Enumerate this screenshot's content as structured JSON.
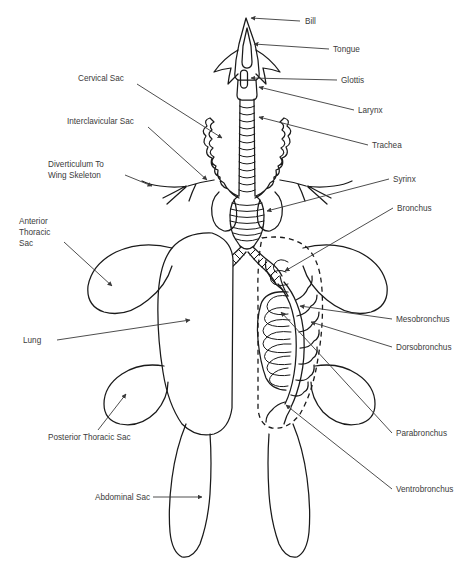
{
  "figure": {
    "background_color": "#ffffff",
    "line_color": "#1a1a1a",
    "label_color": "#3b3b3b",
    "leader_color": "#3a3a3a",
    "caption": ""
  },
  "labels": [
    {
      "id": "bill",
      "text": "Bill",
      "x": 305,
      "y": 24,
      "anchor": "start",
      "lines": 1
    },
    {
      "id": "tongue",
      "text": "Tongue",
      "x": 333,
      "y": 52,
      "anchor": "start",
      "lines": 1
    },
    {
      "id": "glottis",
      "text": "Glottis",
      "x": 341,
      "y": 83,
      "anchor": "start",
      "lines": 1
    },
    {
      "id": "larynx",
      "text": "Larynx",
      "x": 358,
      "y": 113,
      "anchor": "start",
      "lines": 1
    },
    {
      "id": "trachea",
      "text": "Trachea",
      "x": 372,
      "y": 148,
      "anchor": "start",
      "lines": 1
    },
    {
      "id": "syrinx",
      "text": "Syrinx",
      "x": 393,
      "y": 182,
      "anchor": "start",
      "lines": 1
    },
    {
      "id": "bronchus",
      "text": "Bronchus",
      "x": 397,
      "y": 211,
      "anchor": "start",
      "lines": 1
    },
    {
      "id": "mesobronchus",
      "text": "Mesobronchus",
      "x": 396,
      "y": 322,
      "anchor": "start",
      "lines": 1
    },
    {
      "id": "dorsobronchus",
      "text": "Dorsobronchus",
      "x": 396,
      "y": 350,
      "anchor": "start",
      "lines": 1
    },
    {
      "id": "parabronchus",
      "text": "Parabronchus",
      "x": 396,
      "y": 436,
      "anchor": "start",
      "lines": 1
    },
    {
      "id": "ventrobronchus",
      "text": "Ventrobronchus",
      "x": 396,
      "y": 492,
      "anchor": "start",
      "lines": 1
    },
    {
      "id": "cervical-sac",
      "text": "Cervical Sac",
      "x": 78,
      "y": 81,
      "anchor": "start",
      "lines": 1
    },
    {
      "id": "interclavicular-sac",
      "text": "Interclavicular Sac",
      "x": 67,
      "y": 124,
      "anchor": "start",
      "lines": 1
    },
    {
      "id": "diverticulum",
      "text": "Diverticulum To",
      "x": 48,
      "y": 167,
      "anchor": "start",
      "lines": 1
    },
    {
      "id": "diverticulum-2",
      "text": "Wing Skeleton",
      "x": 48,
      "y": 178,
      "anchor": "start",
      "lines": 1
    },
    {
      "id": "anterior-thoracic",
      "text": "Anterior",
      "x": 19,
      "y": 224,
      "anchor": "start",
      "lines": 1
    },
    {
      "id": "anterior-thoracic-2",
      "text": "Thoracic",
      "x": 19,
      "y": 235,
      "anchor": "start",
      "lines": 1
    },
    {
      "id": "anterior-thoracic-3",
      "text": "Sac",
      "x": 19,
      "y": 246,
      "anchor": "start",
      "lines": 1
    },
    {
      "id": "lung",
      "text": "Lung",
      "x": 23,
      "y": 343,
      "anchor": "start",
      "lines": 1
    },
    {
      "id": "posterior-thoracic",
      "text": "Posterior Thoracic Sac",
      "x": 48,
      "y": 440,
      "anchor": "start",
      "lines": 1
    },
    {
      "id": "abdominal-sac",
      "text": "Abdominal Sac",
      "x": 95,
      "y": 500,
      "anchor": "start",
      "lines": 1
    }
  ],
  "structures": [
    {
      "id": "bill",
      "name": "Bill"
    },
    {
      "id": "tongue",
      "name": "Tongue"
    },
    {
      "id": "glottis",
      "name": "Glottis"
    },
    {
      "id": "larynx",
      "name": "Larynx"
    },
    {
      "id": "trachea",
      "name": "Trachea"
    },
    {
      "id": "syrinx",
      "name": "Syrinx"
    },
    {
      "id": "bronchus",
      "name": "Bronchus"
    },
    {
      "id": "mesobronchus",
      "name": "Mesobronchus"
    },
    {
      "id": "dorsobronchus",
      "name": "Dorsobronchus"
    },
    {
      "id": "parabronchus",
      "name": "Parabronchus"
    },
    {
      "id": "ventrobronchus",
      "name": "Ventrobronchus"
    },
    {
      "id": "cervical-sac",
      "name": "Cervical Sac"
    },
    {
      "id": "interclavicular-sac",
      "name": "Interclavicular Sac"
    },
    {
      "id": "diverticulum",
      "name": "Diverticulum To Wing Skeleton"
    },
    {
      "id": "anterior-thoracic",
      "name": "Anterior Thoracic Sac"
    },
    {
      "id": "lung",
      "name": "Lung"
    },
    {
      "id": "posterior-thoracic",
      "name": "Posterior Thoracic Sac"
    },
    {
      "id": "abdominal-sac",
      "name": "Abdominal Sac"
    }
  ]
}
